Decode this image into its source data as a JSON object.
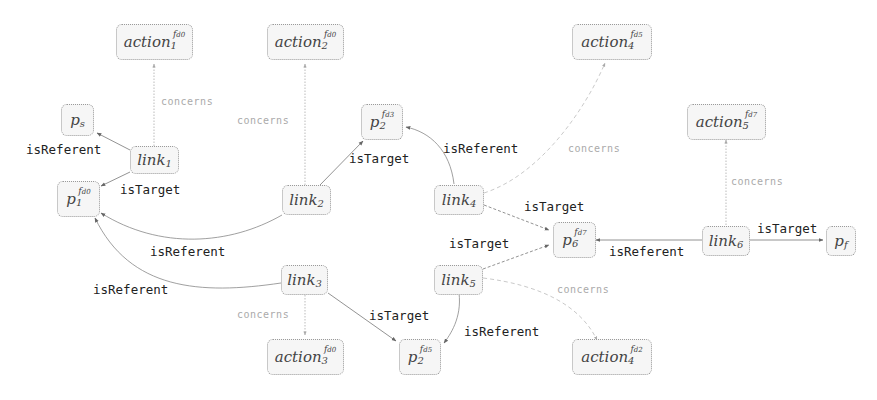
{
  "diagram": {
    "nodes": {
      "action1": {
        "base": "action",
        "sub": "1",
        "sup": "fd0"
      },
      "action2": {
        "base": "action",
        "sub": "2",
        "sup": "fd0"
      },
      "action3": {
        "base": "action",
        "sub": "3",
        "sup": "fd0"
      },
      "action4a": {
        "base": "action",
        "sub": "4",
        "sup": "fd5"
      },
      "action4b": {
        "base": "action",
        "sub": "4",
        "sup": "fd2"
      },
      "action5": {
        "base": "action",
        "sub": "5",
        "sup": "fd7"
      },
      "ps": {
        "base": "p",
        "sub": "s",
        "sup": ""
      },
      "pf": {
        "base": "p",
        "sub": "f",
        "sup": ""
      },
      "p1": {
        "base": "p",
        "sub": "1",
        "sup": "fd0"
      },
      "p2a": {
        "base": "p",
        "sub": "2",
        "sup": "fd3"
      },
      "p2b": {
        "base": "p",
        "sub": "2",
        "sup": "fd5"
      },
      "p6": {
        "base": "p",
        "sub": "6",
        "sup": "fd7"
      },
      "link1": {
        "base": "link",
        "sub": "1",
        "sup": ""
      },
      "link2": {
        "base": "link",
        "sub": "2",
        "sup": ""
      },
      "link3": {
        "base": "link",
        "sub": "3",
        "sup": ""
      },
      "link4": {
        "base": "link",
        "sub": "4",
        "sup": ""
      },
      "link5": {
        "base": "link",
        "sub": "5",
        "sup": ""
      },
      "link6": {
        "base": "link",
        "sub": "6",
        "sup": ""
      }
    },
    "edge_labels": {
      "l1_ps": "isReferent",
      "l1_p1": "isTarget",
      "l1_a1": "concerns",
      "l2_a2": "concerns",
      "l2_p2a": "isTarget",
      "l2_p1": "isReferent",
      "l3_p1": "isReferent",
      "l3_a3": "concerns",
      "l3_p2b": "isTarget",
      "l4_p2a": "isReferent",
      "l4_a4a": "concerns",
      "l4_p6": "isTarget",
      "l5_p6": "isTarget",
      "l5_p2b": "isReferent",
      "l5_a4b": "concerns",
      "l6_a5": "concerns",
      "l6_p6": "isReferent",
      "l6_pf": "isTarget"
    },
    "colors": {
      "solid_edge": "#777777",
      "concerns_edge": "#b0b0b0",
      "node_fill": "#f6f6f6",
      "node_border": "#9a9a9a"
    }
  }
}
